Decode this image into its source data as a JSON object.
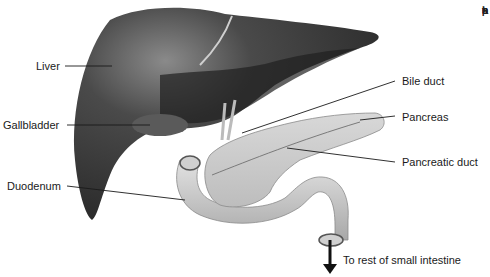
{
  "diagram": {
    "type": "anatomical-illustration",
    "labels": [
      {
        "id": "liver",
        "text": "Liver"
      },
      {
        "id": "gallbladder",
        "text": "Gallbladder"
      },
      {
        "id": "duodenum",
        "text": "Duodenum"
      },
      {
        "id": "bile_duct",
        "text": "Bile duct"
      },
      {
        "id": "pancreas",
        "text": "Pancreas"
      },
      {
        "id": "pancreatic_duct",
        "text": "Pancreatic duct"
      },
      {
        "id": "small_intestine",
        "text": "To rest of small intestine"
      }
    ],
    "cropped_margin_text": [
      "•",
      "s",
      "a",
      "t",
      "p",
      "h",
      "p"
    ]
  },
  "colors": {
    "liver": "#3a3a3a",
    "organ_light": "#c9c9c9",
    "line": "#1a1a1a"
  }
}
